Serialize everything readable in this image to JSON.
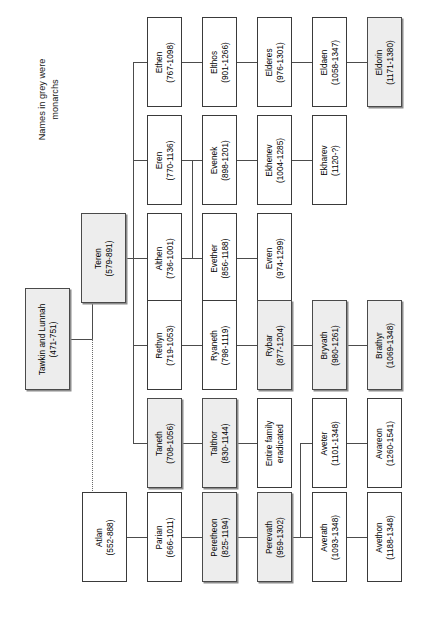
{
  "caption": {
    "line1": "Names in grey were",
    "line2": "monarchs"
  },
  "legend": {
    "monarch_color": "#ededed",
    "plain_color": "#ffffff",
    "line_color": "#4c4c4c"
  },
  "nodes": {
    "root": {
      "name": "Tawkin and Lunnah",
      "years": "(471-751)",
      "monarch": true
    },
    "teren": {
      "name": "Teren",
      "years": "(579-891)",
      "monarch": true
    },
    "atlan": {
      "name": "Atlan",
      "years": "(552-888)",
      "monarch": false
    },
    "ethen": {
      "name": "Ethen",
      "years": "(767-1098)",
      "monarch": false
    },
    "eren": {
      "name": "Eren",
      "years": "(770-1136)",
      "monarch": false
    },
    "althen": {
      "name": "Althen",
      "years": "(736-1001)",
      "monarch": false
    },
    "rethyn": {
      "name": "Rethyn",
      "years": "(719-1053)",
      "monarch": false
    },
    "taneth": {
      "name": "Taneth",
      "years": "(708-1056)",
      "monarch": true
    },
    "parian": {
      "name": "Parian",
      "years": "(666-1011)",
      "monarch": false
    },
    "elthos": {
      "name": "Elthos",
      "years": "(901-1266)",
      "monarch": false
    },
    "evenek": {
      "name": "Evenek",
      "years": "(898-1201)",
      "monarch": false
    },
    "evether": {
      "name": "Evether",
      "years": "(856-1188)",
      "monarch": false
    },
    "ryaneth": {
      "name": "Ryaneth",
      "years": "(798-1119)",
      "monarch": false
    },
    "talthor": {
      "name": "Talthor",
      "years": "(830-1144)",
      "monarch": true
    },
    "peretheon": {
      "name": "Peretheon",
      "years": "(825-1194)",
      "monarch": true
    },
    "elderes": {
      "name": "Elderes",
      "years": "(976-1301)",
      "monarch": false
    },
    "ekhenev": {
      "name": "Ekhenev",
      "years": "(1004-1285)",
      "monarch": false
    },
    "evren": {
      "name": "Evren",
      "years": "(974-1299)",
      "monarch": false
    },
    "rybar": {
      "name": "Rybar",
      "years": "(877-1204)",
      "monarch": true
    },
    "eradicated": {
      "name": "Entire family",
      "years": "eradicated",
      "monarch": false
    },
    "perevath": {
      "name": "Perevath",
      "years": "(959-1302)",
      "monarch": true
    },
    "eldaen": {
      "name": "Eldaen",
      "years": "(1058-1347)",
      "monarch": false
    },
    "ekharev": {
      "name": "Ekharev",
      "years": "(1120-?)",
      "monarch": false
    },
    "bryvath": {
      "name": "Bryvath",
      "years": "(980-1261)",
      "monarch": true
    },
    "aveter": {
      "name": "Aveter",
      "years": "(1101-1348)",
      "monarch": false
    },
    "averath": {
      "name": "Averath",
      "years": "(1093-1348)",
      "monarch": false
    },
    "eldorin": {
      "name": "Eldorin",
      "years": "(1171-1380)",
      "monarch": true
    },
    "brathyr": {
      "name": "Brathyr",
      "years": "(1069-1348)",
      "monarch": true
    },
    "avareon": {
      "name": "Avareon",
      "years": "(1260-1541)",
      "monarch": false
    },
    "avethon": {
      "name": "Avethon",
      "years": "(1188-1348)",
      "monarch": false
    }
  }
}
